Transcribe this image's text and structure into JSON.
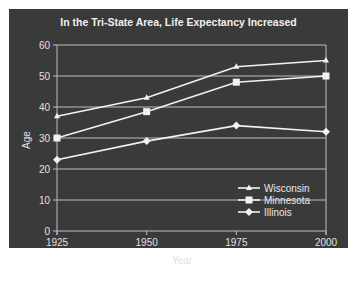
{
  "chart_data": {
    "type": "line",
    "title": "In the Tri-State Area, Life Expectancy Increased",
    "xlabel": "Year",
    "ylabel": "Age",
    "x": [
      "1925",
      "1950",
      "1975",
      "2000"
    ],
    "ylim": [
      0,
      60
    ],
    "yticks": [
      "0",
      "10",
      "20",
      "30",
      "40",
      "50",
      "60"
    ],
    "grid": true,
    "legend_position": "lower right",
    "series": [
      {
        "name": "Wisconsin",
        "marker": "triangle",
        "values": [
          37,
          43,
          53,
          55
        ]
      },
      {
        "name": "Minnesota",
        "marker": "square",
        "values": [
          30,
          38.5,
          48,
          50
        ]
      },
      {
        "name": "Illinois",
        "marker": "diamond",
        "values": [
          23,
          29,
          34,
          32
        ]
      }
    ]
  },
  "colors": {
    "background": "#3a3a3a",
    "lines": "#f2f2f2",
    "grid": "#bdbdbd"
  }
}
